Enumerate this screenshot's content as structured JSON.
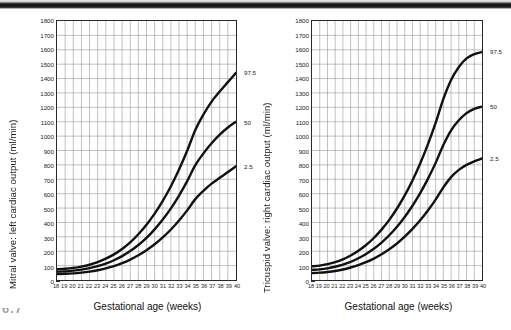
{
  "page": {
    "figure_caption_fragment": "6.7"
  },
  "charts": [
    {
      "id": "mitral-left-cardiac-output",
      "ytitle": "Mitral valve: left cardiac output (ml/min)",
      "xtitle": "Gestational age (weeks)",
      "curve_labels": [
        "97.5",
        "50",
        "2.5"
      ]
    },
    {
      "id": "tricuspid-right-cardiac-output",
      "ytitle": "Tricuspid valve: right cardiac output (ml/min)",
      "xtitle": "Gestational age (weeks)",
      "curve_labels": [
        "97.5",
        "50",
        "2.5"
      ]
    }
  ],
  "chart_data": [
    {
      "type": "line",
      "title": "Mitral valve: left cardiac output (ml/min)",
      "xlabel": "Gestational age (weeks)",
      "ylabel": "Mitral valve: left cardiac output (ml/min)",
      "xlim": [
        18,
        40
      ],
      "ylim": [
        0,
        1800
      ],
      "ytick_step": 100,
      "yticks": [
        0,
        100,
        200,
        300,
        400,
        500,
        600,
        700,
        800,
        900,
        1000,
        1100,
        1200,
        1300,
        1400,
        1500,
        1600,
        1700,
        1800
      ],
      "xticks": [
        18,
        19,
        20,
        21,
        22,
        23,
        24,
        25,
        26,
        27,
        28,
        29,
        30,
        31,
        32,
        33,
        34,
        35,
        36,
        37,
        38,
        39,
        40
      ],
      "grid": true,
      "legend_position": "right-of-axis-at-curve-ends",
      "x": [
        18,
        19,
        20,
        21,
        22,
        23,
        24,
        25,
        26,
        27,
        28,
        29,
        30,
        31,
        32,
        33,
        34,
        35,
        36,
        37,
        38,
        39,
        40
      ],
      "series": [
        {
          "name": "97.5",
          "values": [
            75,
            78,
            84,
            93,
            106,
            124,
            148,
            178,
            216,
            262,
            318,
            384,
            461,
            550,
            652,
            768,
            898,
            1043,
            1150,
            1240,
            1310,
            1375,
            1440
          ]
        },
        {
          "name": "50",
          "values": [
            58,
            60,
            65,
            72,
            82,
            96,
            114,
            137,
            166,
            201,
            243,
            293,
            352,
            420,
            498,
            587,
            687,
            798,
            880,
            950,
            1010,
            1060,
            1100
          ]
        },
        {
          "name": "2.5",
          "values": [
            42,
            43,
            46,
            51,
            58,
            68,
            81,
            97,
            117,
            142,
            172,
            207,
            248,
            296,
            351,
            414,
            484,
            562,
            620,
            670,
            710,
            750,
            790
          ]
        }
      ]
    },
    {
      "type": "line",
      "title": "Tricuspid valve: right cardiac output (ml/min)",
      "xlabel": "Gestational age (weeks)",
      "ylabel": "Tricuspid valve: right cardiac output (ml/min)",
      "xlim": [
        18,
        40
      ],
      "ylim": [
        0,
        1800
      ],
      "ytick_step": 100,
      "yticks": [
        0,
        100,
        200,
        300,
        400,
        500,
        600,
        700,
        800,
        900,
        1000,
        1100,
        1200,
        1300,
        1400,
        1500,
        1600,
        1700,
        1800
      ],
      "xticks": [
        18,
        19,
        20,
        21,
        22,
        23,
        24,
        25,
        26,
        27,
        28,
        29,
        30,
        31,
        32,
        33,
        34,
        35,
        36,
        37,
        38,
        39,
        40
      ],
      "grid": true,
      "legend_position": "right-of-axis-at-curve-ends",
      "x": [
        18,
        19,
        20,
        21,
        22,
        23,
        24,
        25,
        26,
        27,
        28,
        29,
        30,
        31,
        32,
        33,
        34,
        35,
        36,
        37,
        38,
        39,
        40
      ],
      "series": [
        {
          "name": "97.5",
          "values": [
            95,
            100,
            110,
            124,
            144,
            170,
            203,
            243,
            292,
            350,
            418,
            497,
            588,
            692,
            810,
            943,
            1092,
            1258,
            1390,
            1480,
            1540,
            1570,
            1585
          ]
        },
        {
          "name": "50",
          "values": [
            70,
            74,
            81,
            92,
            107,
            126,
            151,
            181,
            217,
            260,
            311,
            370,
            438,
            516,
            604,
            703,
            814,
            938,
            1040,
            1110,
            1160,
            1190,
            1205
          ]
        },
        {
          "name": "2.5",
          "values": [
            48,
            51,
            56,
            63,
            73,
            87,
            104,
            124,
            149,
            179,
            214,
            254,
            301,
            355,
            415,
            483,
            559,
            644,
            715,
            765,
            800,
            825,
            845
          ]
        }
      ]
    }
  ]
}
